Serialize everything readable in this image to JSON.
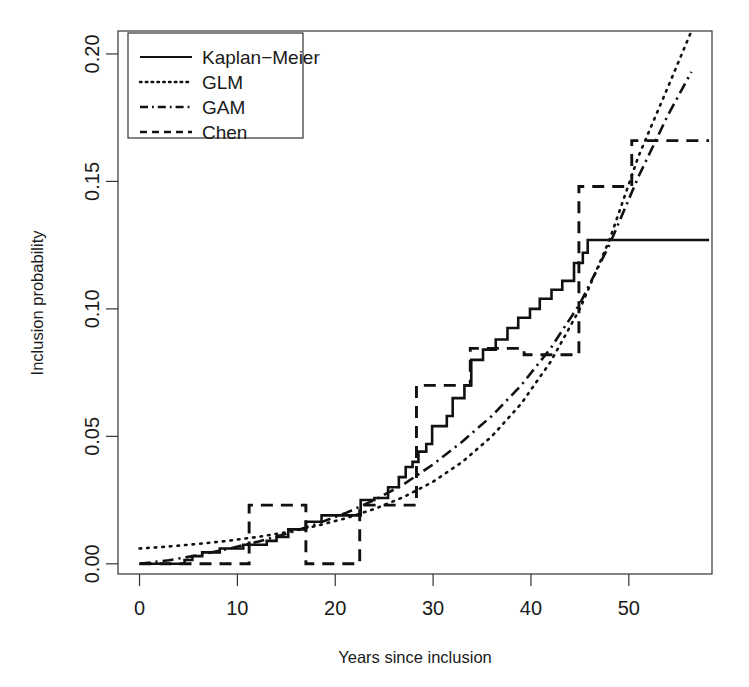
{
  "chart_data": {
    "type": "line",
    "title": "",
    "subtitle": "",
    "xlabel": "Years since inclusion",
    "ylabel": "Inclusion probability",
    "xlim": [
      -2.2,
      58.5
    ],
    "ylim": [
      -0.004,
      0.209
    ],
    "xticks": [
      0,
      10,
      20,
      30,
      40,
      50
    ],
    "xticklabels": [
      "0",
      "10",
      "20",
      "30",
      "40",
      "50"
    ],
    "yticks": [
      0.0,
      0.05,
      0.1,
      0.15,
      0.2
    ],
    "yticklabels": [
      "0.00",
      "0.05",
      "0.10",
      "0.15",
      "0.20"
    ],
    "grid": false,
    "legend_position": "top-left",
    "series": [
      {
        "name": "Kaplan-Meier",
        "style": "solid",
        "type": "step",
        "points": [
          [
            0.0,
            0.0
          ],
          [
            4.6,
            0.0
          ],
          [
            4.6,
            0.0015
          ],
          [
            5.4,
            0.0015
          ],
          [
            5.4,
            0.003
          ],
          [
            6.4,
            0.003
          ],
          [
            6.4,
            0.0045
          ],
          [
            8.2,
            0.0045
          ],
          [
            8.2,
            0.006
          ],
          [
            10.6,
            0.006
          ],
          [
            10.6,
            0.0075
          ],
          [
            13.0,
            0.0075
          ],
          [
            13.0,
            0.009
          ],
          [
            14.0,
            0.009
          ],
          [
            14.0,
            0.0105
          ],
          [
            15.2,
            0.0105
          ],
          [
            15.2,
            0.0135
          ],
          [
            17.0,
            0.0135
          ],
          [
            17.0,
            0.0165
          ],
          [
            18.6,
            0.0165
          ],
          [
            18.6,
            0.019
          ],
          [
            22.6,
            0.019
          ],
          [
            22.6,
            0.025
          ],
          [
            24.0,
            0.025
          ],
          [
            24.0,
            0.0258
          ],
          [
            25.4,
            0.0258
          ],
          [
            25.4,
            0.03
          ],
          [
            26.5,
            0.03
          ],
          [
            26.5,
            0.034
          ],
          [
            27.2,
            0.034
          ],
          [
            27.2,
            0.038
          ],
          [
            27.9,
            0.038
          ],
          [
            27.9,
            0.04
          ],
          [
            28.5,
            0.04
          ],
          [
            28.5,
            0.044
          ],
          [
            29.3,
            0.044
          ],
          [
            29.3,
            0.047
          ],
          [
            29.9,
            0.047
          ],
          [
            29.9,
            0.054
          ],
          [
            31.4,
            0.054
          ],
          [
            31.4,
            0.058
          ],
          [
            32.0,
            0.058
          ],
          [
            32.0,
            0.065
          ],
          [
            33.2,
            0.065
          ],
          [
            33.2,
            0.07
          ],
          [
            33.9,
            0.07
          ],
          [
            33.9,
            0.08
          ],
          [
            35.1,
            0.08
          ],
          [
            35.1,
            0.084
          ],
          [
            36.4,
            0.084
          ],
          [
            36.4,
            0.088
          ],
          [
            37.6,
            0.088
          ],
          [
            37.6,
            0.0925
          ],
          [
            38.7,
            0.0925
          ],
          [
            38.7,
            0.0965
          ],
          [
            39.9,
            0.0965
          ],
          [
            39.9,
            0.1
          ],
          [
            40.9,
            0.1
          ],
          [
            40.9,
            0.104
          ],
          [
            42.1,
            0.104
          ],
          [
            42.1,
            0.1075
          ],
          [
            43.2,
            0.1075
          ],
          [
            43.2,
            0.111
          ],
          [
            44.4,
            0.111
          ],
          [
            44.4,
            0.118
          ],
          [
            45.3,
            0.118
          ],
          [
            45.3,
            0.122
          ],
          [
            45.8,
            0.122
          ],
          [
            45.8,
            0.127
          ],
          [
            58.2,
            0.127
          ]
        ]
      },
      {
        "name": "GLM",
        "style": "dotted",
        "type": "smooth",
        "points": [
          [
            0.0,
            0.006
          ],
          [
            3.0,
            0.0068
          ],
          [
            6.0,
            0.0078
          ],
          [
            9.0,
            0.009
          ],
          [
            12.0,
            0.0105
          ],
          [
            15.0,
            0.0124
          ],
          [
            18.0,
            0.0148
          ],
          [
            21.0,
            0.0178
          ],
          [
            24.0,
            0.0215
          ],
          [
            27.0,
            0.0262
          ],
          [
            30.0,
            0.0322
          ],
          [
            33.0,
            0.04
          ],
          [
            36.0,
            0.05
          ],
          [
            39.0,
            0.0628
          ],
          [
            42.0,
            0.0792
          ],
          [
            45.0,
            0.1
          ],
          [
            48.0,
            0.1268
          ],
          [
            51.0,
            0.16
          ],
          [
            54.0,
            0.187
          ],
          [
            56.4,
            0.209
          ]
        ]
      },
      {
        "name": "GAM",
        "style": "dashdot",
        "type": "smooth",
        "points": [
          [
            0.0,
            0.0
          ],
          [
            3.0,
            0.0014
          ],
          [
            6.0,
            0.0034
          ],
          [
            9.0,
            0.0058
          ],
          [
            12.0,
            0.0086
          ],
          [
            15.0,
            0.0118
          ],
          [
            18.0,
            0.0155
          ],
          [
            21.0,
            0.0198
          ],
          [
            24.0,
            0.025
          ],
          [
            27.0,
            0.0312
          ],
          [
            30.0,
            0.039
          ],
          [
            33.0,
            0.048
          ],
          [
            36.0,
            0.058
          ],
          [
            39.0,
            0.07
          ],
          [
            42.0,
            0.0845
          ],
          [
            45.0,
            0.102
          ],
          [
            48.0,
            0.125
          ],
          [
            51.0,
            0.152
          ],
          [
            54.0,
            0.176
          ],
          [
            56.4,
            0.193
          ]
        ]
      },
      {
        "name": "Chen",
        "style": "dashed",
        "type": "step",
        "points": [
          [
            0.0,
            0.0
          ],
          [
            11.2,
            0.0
          ],
          [
            11.2,
            0.023
          ],
          [
            17.0,
            0.023
          ],
          [
            17.0,
            0.0
          ],
          [
            22.5,
            0.0
          ],
          [
            22.5,
            0.023
          ],
          [
            28.3,
            0.023
          ],
          [
            28.3,
            0.07
          ],
          [
            33.8,
            0.07
          ],
          [
            33.8,
            0.0845
          ],
          [
            39.3,
            0.0845
          ],
          [
            39.3,
            0.082
          ],
          [
            44.9,
            0.082
          ],
          [
            44.9,
            0.148
          ],
          [
            50.3,
            0.148
          ],
          [
            50.3,
            0.166
          ],
          [
            58.2,
            0.166
          ]
        ]
      }
    ]
  },
  "legend": {
    "entries": [
      {
        "label": "Kaplan−Meier",
        "style": "solid"
      },
      {
        "label": "GLM",
        "style": "dotted"
      },
      {
        "label": "GAM",
        "style": "dashdot"
      },
      {
        "label": "Chen",
        "style": "dashed"
      }
    ]
  }
}
